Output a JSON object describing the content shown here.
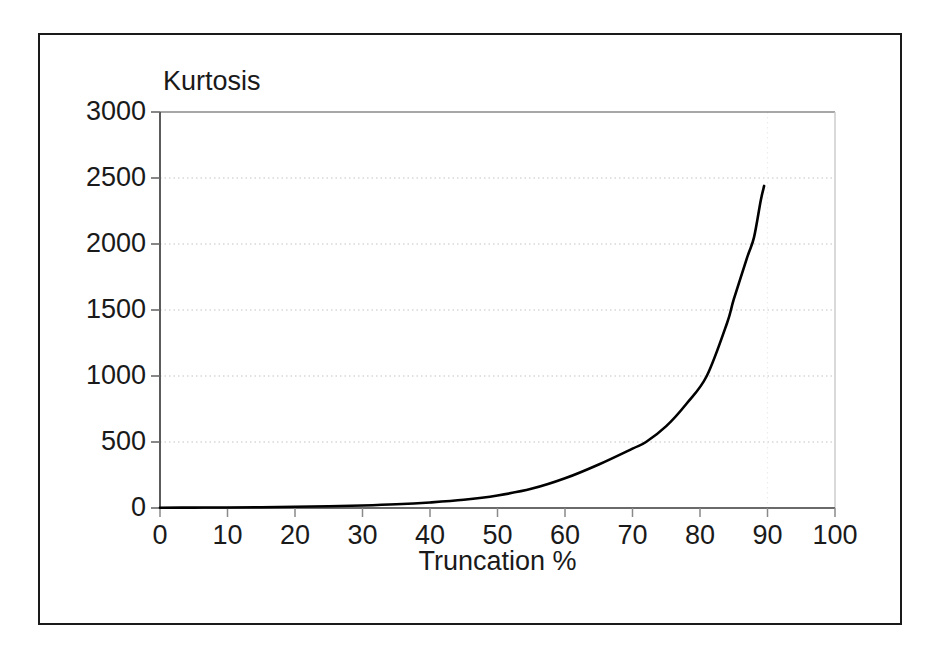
{
  "chart_data": {
    "type": "line",
    "title": "",
    "xlabel": "Truncation %",
    "ylabel": "Kurtosis",
    "xlim": [
      0,
      100
    ],
    "ylim": [
      0,
      3000
    ],
    "xticks": [
      0,
      10,
      20,
      30,
      40,
      50,
      60,
      70,
      80,
      90,
      100
    ],
    "yticks": [
      0,
      500,
      1000,
      1500,
      2000,
      2500,
      3000
    ],
    "xtick_labels": [
      "0",
      "10",
      "20",
      "30",
      "40",
      "50",
      "60",
      "70",
      "80",
      "90",
      "100"
    ],
    "ytick_labels": [
      "0",
      "500",
      "1000",
      "1500",
      "2000",
      "2500",
      "3000"
    ],
    "grid": true,
    "grid_style": "dotted",
    "grid_color": "#d8d8d8",
    "legend": false,
    "line_color": "#000000",
    "series": [
      {
        "name": "Kurtosis vs Truncation",
        "x": [
          0,
          5,
          10,
          15,
          20,
          25,
          30,
          35,
          40,
          45,
          50,
          55,
          60,
          65,
          70,
          72,
          75,
          78,
          81,
          84,
          85,
          87,
          88,
          89,
          89.5
        ],
        "values": [
          2,
          3,
          4,
          6,
          9,
          13,
          19,
          28,
          42,
          62,
          95,
          145,
          225,
          330,
          450,
          500,
          620,
          790,
          1000,
          1400,
          1580,
          1900,
          2050,
          2330,
          2440
        ]
      }
    ]
  },
  "axes": {
    "ylabel_text": "Kurtosis",
    "xlabel_text": "Truncation %"
  }
}
